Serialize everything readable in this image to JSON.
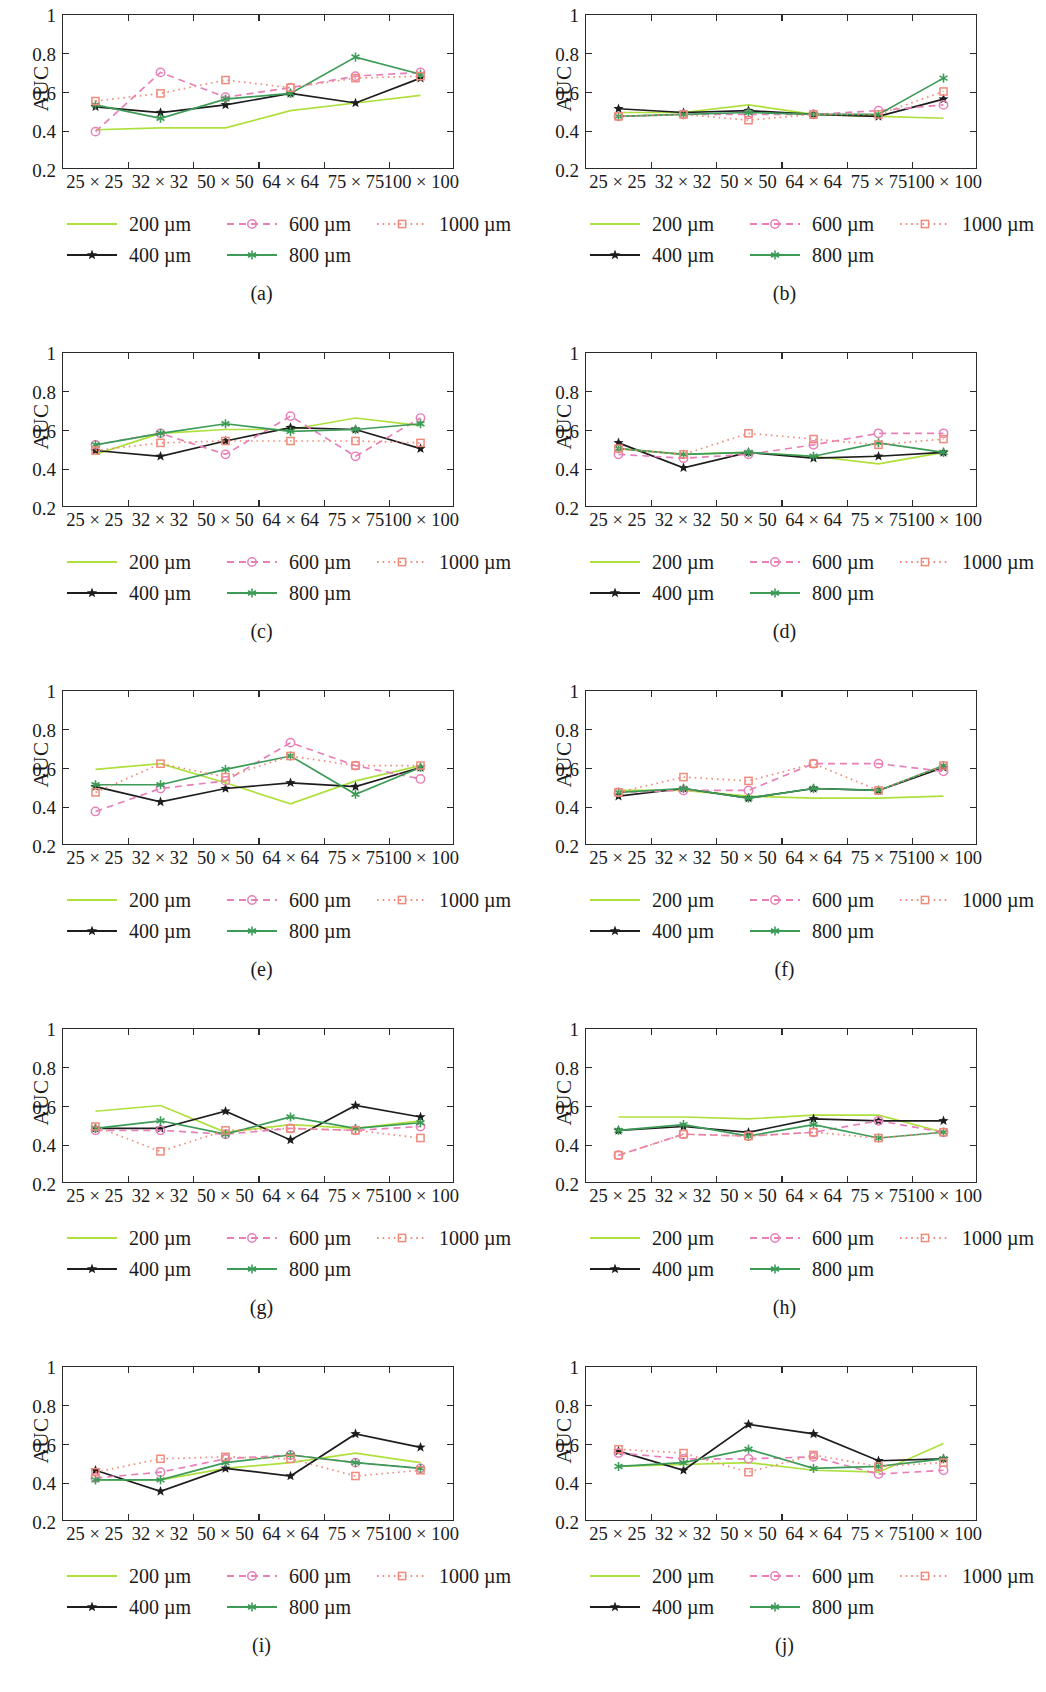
{
  "figure": {
    "axis_label": "AUC",
    "panel_count": 10,
    "colors": {
      "200um": "#aee03c",
      "400um": "#1d1d1d",
      "600um": "#e87fb8",
      "800um": "#3c9b57",
      "1000um": "#f08a7a"
    }
  },
  "legend": {
    "items": [
      {
        "label": "200 µm",
        "key": "200um",
        "style": "solid",
        "marker": "none",
        "color": "#aee03c"
      },
      {
        "label": "400 µm",
        "key": "400um",
        "style": "solid",
        "marker": "star",
        "color": "#1d1d1d"
      },
      {
        "label": "600 µm",
        "key": "600um",
        "style": "dashed",
        "marker": "circle",
        "color": "#e87fb8"
      },
      {
        "label": "800 µm",
        "key": "800um",
        "style": "solid",
        "marker": "asterisk",
        "color": "#3c9b57"
      },
      {
        "label": "1000 µm",
        "key": "1000um",
        "style": "dotted",
        "marker": "square",
        "color": "#f08a7a"
      }
    ]
  },
  "chart_data": [
    {
      "panel": "(a)",
      "type": "line",
      "title": "",
      "xlabel": "",
      "ylabel": "AUC",
      "categories": [
        "25 × 25",
        "32 × 32",
        "50 × 50",
        "64 × 64",
        "75 × 75",
        "100 × 100"
      ],
      "ylim": [
        0.2,
        1.0
      ],
      "yticks": [
        0.2,
        0.4,
        0.6,
        0.8,
        1.0
      ],
      "ytick_labels": [
        "0.2",
        "0.4",
        "0.6",
        "0.8",
        "1"
      ],
      "grid": false,
      "legend_position": "below",
      "series": [
        {
          "name": "200 µm",
          "values": [
            0.4,
            0.41,
            0.41,
            0.5,
            0.54,
            0.58
          ]
        },
        {
          "name": "400 µm",
          "values": [
            0.52,
            0.49,
            0.53,
            0.59,
            0.54,
            0.67
          ]
        },
        {
          "name": "600 µm",
          "values": [
            0.39,
            0.7,
            0.57,
            0.62,
            0.68,
            0.7
          ]
        },
        {
          "name": "800 µm",
          "values": [
            0.53,
            0.46,
            0.56,
            0.59,
            0.78,
            0.69
          ]
        },
        {
          "name": "1000 µm",
          "values": [
            0.55,
            0.59,
            0.66,
            0.62,
            0.67,
            0.68
          ]
        }
      ]
    },
    {
      "panel": "(b)",
      "type": "line",
      "title": "",
      "xlabel": "",
      "ylabel": "AUC",
      "categories": [
        "25 × 25",
        "32 × 32",
        "50 × 50",
        "64 × 64",
        "75 × 75",
        "100 × 100"
      ],
      "ylim": [
        0.2,
        1.0
      ],
      "yticks": [
        0.2,
        0.4,
        0.6,
        0.8,
        1.0
      ],
      "ytick_labels": [
        "0.2",
        "0.4",
        "0.6",
        "0.8",
        "1"
      ],
      "grid": false,
      "legend_position": "below",
      "series": [
        {
          "name": "200 µm",
          "values": [
            0.49,
            0.49,
            0.53,
            0.48,
            0.47,
            0.46
          ]
        },
        {
          "name": "400 µm",
          "values": [
            0.51,
            0.49,
            0.5,
            0.48,
            0.47,
            0.56
          ]
        },
        {
          "name": "600 µm",
          "values": [
            0.47,
            0.48,
            0.48,
            0.48,
            0.5,
            0.53
          ]
        },
        {
          "name": "800 µm",
          "values": [
            0.47,
            0.48,
            0.49,
            0.48,
            0.48,
            0.67
          ]
        },
        {
          "name": "1000 µm",
          "values": [
            0.47,
            0.48,
            0.45,
            0.48,
            0.48,
            0.6
          ]
        }
      ]
    },
    {
      "panel": "(c)",
      "type": "line",
      "title": "",
      "xlabel": "",
      "ylabel": "AUC",
      "categories": [
        "25 × 25",
        "32 × 32",
        "50 × 50",
        "64 × 64",
        "75 × 75",
        "100 × 100"
      ],
      "ylim": [
        0.2,
        1.0
      ],
      "yticks": [
        0.2,
        0.4,
        0.6,
        0.8,
        1.0
      ],
      "ytick_labels": [
        "0.2",
        "0.4",
        "0.6",
        "0.8",
        "1"
      ],
      "grid": false,
      "legend_position": "below",
      "series": [
        {
          "name": "200 µm",
          "values": [
            0.47,
            0.58,
            0.6,
            0.6,
            0.66,
            0.62
          ]
        },
        {
          "name": "400 µm",
          "values": [
            0.49,
            0.46,
            0.54,
            0.61,
            0.6,
            0.5
          ]
        },
        {
          "name": "600 µm",
          "values": [
            0.52,
            0.58,
            0.47,
            0.67,
            0.46,
            0.66
          ]
        },
        {
          "name": "800 µm",
          "values": [
            0.52,
            0.58,
            0.63,
            0.59,
            0.6,
            0.63
          ]
        },
        {
          "name": "1000 µm",
          "values": [
            0.49,
            0.53,
            0.54,
            0.54,
            0.54,
            0.53
          ]
        }
      ]
    },
    {
      "panel": "(d)",
      "type": "line",
      "title": "",
      "xlabel": "",
      "ylabel": "AUC",
      "categories": [
        "25 × 25",
        "32 × 32",
        "50 × 50",
        "64 × 64",
        "75 × 75",
        "100 × 100"
      ],
      "ylim": [
        0.2,
        1.0
      ],
      "yticks": [
        0.2,
        0.4,
        0.6,
        0.8,
        1.0
      ],
      "ytick_labels": [
        "0.2",
        "0.4",
        "0.6",
        "0.8",
        "1"
      ],
      "grid": false,
      "legend_position": "below",
      "series": [
        {
          "name": "200 µm",
          "values": [
            0.5,
            0.47,
            0.48,
            0.46,
            0.42,
            0.48
          ]
        },
        {
          "name": "400 µm",
          "values": [
            0.53,
            0.4,
            0.48,
            0.45,
            0.46,
            0.48
          ]
        },
        {
          "name": "600 µm",
          "values": [
            0.47,
            0.45,
            0.47,
            0.52,
            0.58,
            0.58
          ]
        },
        {
          "name": "800 µm",
          "values": [
            0.5,
            0.47,
            0.48,
            0.46,
            0.53,
            0.48
          ]
        },
        {
          "name": "1000 µm",
          "values": [
            0.5,
            0.47,
            0.58,
            0.55,
            0.52,
            0.55
          ]
        }
      ]
    },
    {
      "panel": "(e)",
      "type": "line",
      "title": "",
      "xlabel": "",
      "ylabel": "AUC",
      "categories": [
        "25 × 25",
        "32 × 32",
        "50 × 50",
        "64 × 64",
        "75 × 75",
        "100 × 100"
      ],
      "ylim": [
        0.2,
        1.0
      ],
      "yticks": [
        0.2,
        0.4,
        0.6,
        0.8,
        1.0
      ],
      "ytick_labels": [
        "0.2",
        "0.4",
        "0.6",
        "0.8",
        "1"
      ],
      "grid": false,
      "legend_position": "below",
      "series": [
        {
          "name": "200 µm",
          "values": [
            0.59,
            0.62,
            0.52,
            0.41,
            0.53,
            0.61
          ]
        },
        {
          "name": "400 µm",
          "values": [
            0.5,
            0.42,
            0.49,
            0.52,
            0.5,
            0.6
          ]
        },
        {
          "name": "600 µm",
          "values": [
            0.37,
            0.49,
            0.53,
            0.73,
            0.61,
            0.54
          ]
        },
        {
          "name": "800 µm",
          "values": [
            0.51,
            0.51,
            0.59,
            0.66,
            0.46,
            0.6
          ]
        },
        {
          "name": "1000 µm",
          "values": [
            0.47,
            0.62,
            0.55,
            0.66,
            0.61,
            0.61
          ]
        }
      ]
    },
    {
      "panel": "(f)",
      "type": "line",
      "title": "",
      "xlabel": "",
      "ylabel": "AUC",
      "categories": [
        "25 × 25",
        "32 × 32",
        "50 × 50",
        "64 × 64",
        "75 × 75",
        "100 × 100"
      ],
      "ylim": [
        0.2,
        1.0
      ],
      "yticks": [
        0.2,
        0.4,
        0.6,
        0.8,
        1.0
      ],
      "ytick_labels": [
        "0.2",
        "0.4",
        "0.6",
        "0.8",
        "1"
      ],
      "grid": false,
      "legend_position": "below",
      "series": [
        {
          "name": "200 µm",
          "values": [
            0.48,
            0.48,
            0.45,
            0.44,
            0.44,
            0.45
          ]
        },
        {
          "name": "400 µm",
          "values": [
            0.45,
            0.49,
            0.44,
            0.49,
            0.48,
            0.6
          ]
        },
        {
          "name": "600 µm",
          "values": [
            0.47,
            0.48,
            0.48,
            0.62,
            0.62,
            0.58
          ]
        },
        {
          "name": "800 µm",
          "values": [
            0.47,
            0.49,
            0.44,
            0.49,
            0.48,
            0.61
          ]
        },
        {
          "name": "1000 µm",
          "values": [
            0.47,
            0.55,
            0.53,
            0.62,
            0.48,
            0.61
          ]
        }
      ]
    },
    {
      "panel": "(g)",
      "type": "line",
      "title": "",
      "xlabel": "",
      "ylabel": "AUC",
      "categories": [
        "25 × 25",
        "32 × 32",
        "50 × 50",
        "64 × 64",
        "75 × 75",
        "100 × 100"
      ],
      "ylim": [
        0.2,
        1.0
      ],
      "yticks": [
        0.2,
        0.4,
        0.6,
        0.8,
        1.0
      ],
      "ytick_labels": [
        "0.2",
        "0.4",
        "0.6",
        "0.8",
        "1"
      ],
      "grid": false,
      "legend_position": "below",
      "series": [
        {
          "name": "200 µm",
          "values": [
            0.57,
            0.6,
            0.46,
            0.5,
            0.48,
            0.52
          ]
        },
        {
          "name": "400 µm",
          "values": [
            0.48,
            0.48,
            0.57,
            0.42,
            0.6,
            0.54
          ]
        },
        {
          "name": "600 µm",
          "values": [
            0.47,
            0.47,
            0.45,
            0.48,
            0.47,
            0.49
          ]
        },
        {
          "name": "800 µm",
          "values": [
            0.48,
            0.52,
            0.45,
            0.54,
            0.48,
            0.51
          ]
        },
        {
          "name": "1000 µm",
          "values": [
            0.49,
            0.36,
            0.47,
            0.48,
            0.47,
            0.43
          ]
        }
      ]
    },
    {
      "panel": "(h)",
      "type": "line",
      "title": "",
      "xlabel": "",
      "ylabel": "AUC",
      "categories": [
        "25 × 25",
        "32 × 32",
        "50 × 50",
        "64 × 64",
        "75 × 75",
        "100 × 100"
      ],
      "ylim": [
        0.2,
        1.0
      ],
      "yticks": [
        0.2,
        0.4,
        0.6,
        0.8,
        1.0
      ],
      "ytick_labels": [
        "0.2",
        "0.4",
        "0.6",
        "0.8",
        "1"
      ],
      "grid": false,
      "legend_position": "below",
      "series": [
        {
          "name": "200 µm",
          "values": [
            0.54,
            0.54,
            0.53,
            0.55,
            0.55,
            0.46
          ]
        },
        {
          "name": "400 µm",
          "values": [
            0.47,
            0.49,
            0.46,
            0.53,
            0.52,
            0.52
          ]
        },
        {
          "name": "600 µm",
          "values": [
            0.34,
            0.45,
            0.44,
            0.46,
            0.52,
            0.46
          ]
        },
        {
          "name": "800 µm",
          "values": [
            0.47,
            0.5,
            0.44,
            0.5,
            0.43,
            0.46
          ]
        },
        {
          "name": "1000 µm",
          "values": [
            0.34,
            0.45,
            0.44,
            0.46,
            0.43,
            0.46
          ]
        }
      ]
    },
    {
      "panel": "(i)",
      "type": "line",
      "title": "",
      "xlabel": "",
      "ylabel": "AUC",
      "categories": [
        "25 × 25",
        "32 × 32",
        "50 × 50",
        "64 × 64",
        "75 × 75",
        "100 × 100"
      ],
      "ylim": [
        0.2,
        1.0
      ],
      "yticks": [
        0.2,
        0.4,
        0.6,
        0.8,
        1.0
      ],
      "ytick_labels": [
        "0.2",
        "0.4",
        "0.6",
        "0.8",
        "1"
      ],
      "grid": false,
      "legend_position": "below",
      "series": [
        {
          "name": "200 µm",
          "values": [
            0.41,
            0.41,
            0.47,
            0.5,
            0.55,
            0.5
          ]
        },
        {
          "name": "400 µm",
          "values": [
            0.46,
            0.35,
            0.47,
            0.43,
            0.65,
            0.58
          ]
        },
        {
          "name": "600 µm",
          "values": [
            0.42,
            0.45,
            0.52,
            0.54,
            0.5,
            0.47
          ]
        },
        {
          "name": "800 µm",
          "values": [
            0.41,
            0.41,
            0.5,
            0.54,
            0.5,
            0.47
          ]
        },
        {
          "name": "1000 µm",
          "values": [
            0.45,
            0.52,
            0.53,
            0.52,
            0.43,
            0.46
          ]
        }
      ]
    },
    {
      "panel": "(j)",
      "type": "line",
      "title": "",
      "xlabel": "",
      "ylabel": "AUC",
      "categories": [
        "25 × 25",
        "32 × 32",
        "50 × 50",
        "64 × 64",
        "75 × 75",
        "100 × 100"
      ],
      "ylim": [
        0.2,
        1.0
      ],
      "yticks": [
        0.2,
        0.4,
        0.6,
        0.8,
        1.0
      ],
      "ytick_labels": [
        "0.2",
        "0.4",
        "0.6",
        "0.8",
        "1"
      ],
      "grid": false,
      "legend_position": "below",
      "series": [
        {
          "name": "200 µm",
          "values": [
            0.48,
            0.49,
            0.5,
            0.46,
            0.45,
            0.6
          ]
        },
        {
          "name": "400 µm",
          "values": [
            0.56,
            0.46,
            0.7,
            0.65,
            0.51,
            0.52
          ]
        },
        {
          "name": "600 µm",
          "values": [
            0.55,
            0.52,
            0.52,
            0.53,
            0.44,
            0.46
          ]
        },
        {
          "name": "800 µm",
          "values": [
            0.48,
            0.5,
            0.57,
            0.47,
            0.48,
            0.52
          ]
        },
        {
          "name": "1000 µm",
          "values": [
            0.57,
            0.55,
            0.45,
            0.54,
            0.48,
            0.5
          ]
        }
      ]
    }
  ]
}
